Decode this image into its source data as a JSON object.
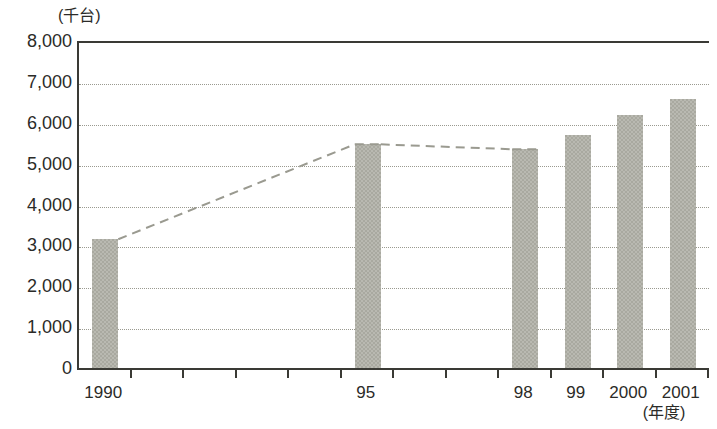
{
  "chart_data": {
    "type": "bar",
    "title": "",
    "subtitle": "",
    "xlabel": "(年度)",
    "ylabel": "(千台)",
    "categories": [
      "1990",
      "95",
      "98",
      "99",
      "2000",
      "2001"
    ],
    "values": [
      3200,
      5520,
      5400,
      5750,
      6250,
      6620
    ],
    "series": [
      {
        "name": "台数",
        "values": [
          3200,
          5520,
          5400,
          5750,
          6250,
          6620
        ]
      }
    ],
    "ylim": [
      0,
      8000
    ],
    "ytick_labels": [
      "8,000",
      "7,000",
      "6,000",
      "5,000",
      "4,000",
      "3,000",
      "2,000",
      "1,000",
      "0"
    ],
    "ytick_values": [
      8000,
      7000,
      6000,
      5000,
      4000,
      3000,
      2000,
      1000,
      0
    ],
    "grid": true,
    "grid_style": "dotted-horizontal",
    "legend": "none",
    "legend_position": "none",
    "annotations": [
      {
        "type": "dashed-line",
        "label": "trend",
        "points": [
          "1990",
          "95",
          "98"
        ],
        "values": [
          3200,
          5520,
          5400
        ]
      }
    ],
    "bar_color": "#a9a9a0",
    "axis_color": "#3a3a35",
    "grid_color": "#9a9a90",
    "trend_color": "#9a9a90"
  },
  "axis": {
    "y_unit": "(千台)",
    "x_unit": "(年度)",
    "y_ticks": [
      {
        "label": "8,000",
        "value": 8000
      },
      {
        "label": "7,000",
        "value": 7000
      },
      {
        "label": "6,000",
        "value": 6000
      },
      {
        "label": "5,000",
        "value": 5000
      },
      {
        "label": "4,000",
        "value": 4000
      },
      {
        "label": "3,000",
        "value": 3000
      },
      {
        "label": "2,000",
        "value": 2000
      },
      {
        "label": "1,000",
        "value": 1000
      },
      {
        "label": "0",
        "value": 0
      }
    ],
    "x_ticks": [
      {
        "label": "1990",
        "value": 3200,
        "index": 0
      },
      {
        "label": "95",
        "value": 5520,
        "index": 5
      },
      {
        "label": "98",
        "value": 5400,
        "index": 8
      },
      {
        "label": "99",
        "value": 5750,
        "index": 9
      },
      {
        "label": "2000",
        "value": 6250,
        "index": 10
      },
      {
        "label": "2001",
        "value": 6620,
        "index": 11
      }
    ]
  }
}
